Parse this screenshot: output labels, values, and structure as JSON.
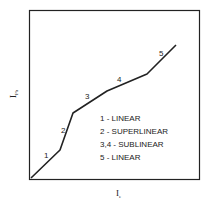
{
  "chart_data": {
    "type": "line",
    "title": "",
    "xlabel": "I_e",
    "ylabel": "I_Ph",
    "xlabel_main": "I",
    "xlabel_sub": "e",
    "ylabel_main": "I",
    "ylabel_sub": "Ph",
    "grid": false,
    "axis_ticks": false,
    "points_px": [
      [
        31,
        178
      ],
      [
        60,
        150
      ],
      [
        73,
        113
      ],
      [
        107,
        91
      ],
      [
        147,
        74
      ],
      [
        176,
        45
      ]
    ],
    "segments": [
      {
        "id": "1",
        "label": "1",
        "pos": [
          44,
          158
        ]
      },
      {
        "id": "2",
        "label": "2",
        "pos": [
          61,
          133
        ]
      },
      {
        "id": "3",
        "label": "3",
        "pos": [
          85,
          99
        ]
      },
      {
        "id": "4",
        "label": "4",
        "pos": [
          117,
          82
        ]
      },
      {
        "id": "5",
        "label": "5",
        "pos": [
          159,
          56
        ]
      }
    ],
    "legend": [
      "1 - LINEAR",
      "2 - SUPERLINEAR",
      "3,4 - SUBLINEAR",
      "5 - LINEAR"
    ]
  }
}
